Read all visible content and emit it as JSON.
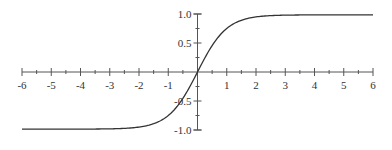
{
  "chart_data": {
    "type": "line",
    "title": "",
    "xlabel": "",
    "ylabel": "",
    "function": "tanh(x)",
    "xlim": [
      -6,
      6
    ],
    "ylim": [
      -1.0,
      1.0
    ],
    "grid": false,
    "legend": null,
    "x_ticks": [
      -6,
      -5,
      -4,
      -3,
      -2,
      -1,
      1,
      2,
      3,
      4,
      5,
      6
    ],
    "x_tick_labels": [
      "-6",
      "-5",
      "-4",
      "-3",
      "-2",
      "-1",
      "1",
      "2",
      "3",
      "4",
      "5",
      "6"
    ],
    "y_ticks": [
      1.0,
      0.5,
      -0.5,
      -1.0
    ],
    "y_tick_labels": [
      "1.0",
      "0.5",
      "-0.5",
      "-1.0"
    ],
    "series": [
      {
        "name": "tanh(x)",
        "x": [
          -6,
          -5,
          -4,
          -3,
          -2,
          -1.5,
          -1,
          -0.5,
          0,
          0.5,
          1,
          1.5,
          2,
          3,
          4,
          5,
          6
        ],
        "values": [
          -1.0,
          -1.0,
          -0.999,
          -0.995,
          -0.964,
          -0.905,
          -0.762,
          -0.462,
          0,
          0.462,
          0.762,
          0.905,
          0.964,
          0.995,
          0.999,
          1.0,
          1.0
        ],
        "color": "#333333"
      }
    ]
  },
  "colors": {
    "axis": "#555555",
    "curve": "#333333",
    "background": "#ffffff"
  }
}
